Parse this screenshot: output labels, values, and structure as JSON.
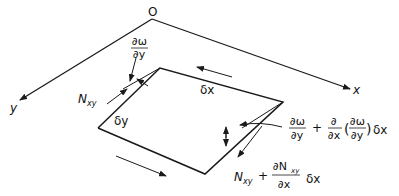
{
  "diagram": {
    "origin_label": "O",
    "axes": {
      "x_label": "x",
      "y_label": "y"
    },
    "element": {
      "dx_label": "δx",
      "dy_label": "δy"
    },
    "labels": {
      "slope_left_num": "∂ω",
      "slope_left_den": "∂y",
      "shear_left_N": "N",
      "shear_left_sub": "xy",
      "slope_right_a_num": "∂ω",
      "slope_right_a_den": "∂y",
      "plus1": "+",
      "slope_right_b_num": "∂",
      "slope_right_b_den": "∂x",
      "paren_open": "(",
      "slope_right_c_num": "∂ω",
      "slope_right_c_den": "∂y",
      "paren_close": ")",
      "slope_right_dx": "δx",
      "shear_right_N": "N",
      "shear_right_sub": "xy",
      "plus2": "+",
      "shear_right_frac_num": "∂N",
      "shear_right_frac_num_sub": "xy",
      "shear_right_frac_den": "∂x",
      "shear_right_dx": "δx"
    },
    "colors": {
      "stroke": "#1a1a1a",
      "background": "#ffffff"
    }
  }
}
